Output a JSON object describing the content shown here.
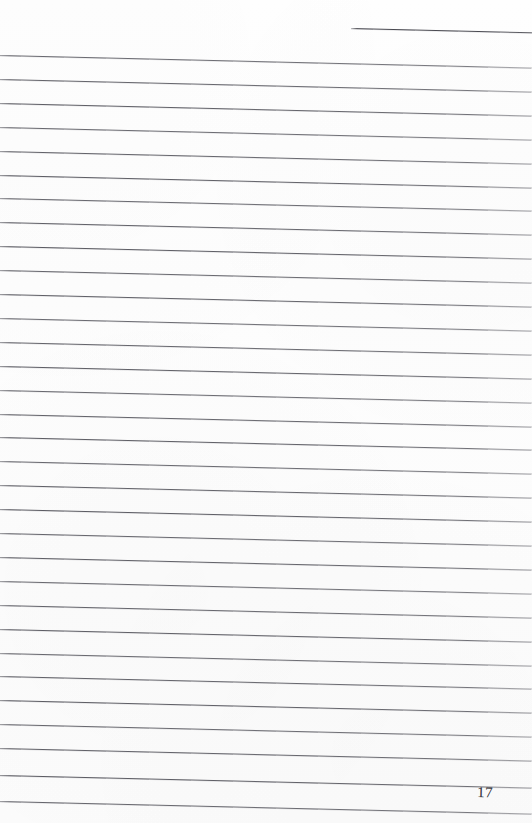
{
  "document": {
    "type": "scanned-ruled-notebook-page",
    "page_number": "17",
    "paper_color": "#fdfdfd",
    "rule_color": "#4a4a52",
    "folio_color": "#3b3b42",
    "canvas": {
      "width": 532,
      "height": 823
    },
    "skew_degrees": 1.35,
    "rule_spacing_px": 23.9,
    "written_content": "",
    "notes": "Blank ruled sheet: no handwriting, no headings, no margin rule; only the printed horizontal rules and the printed folio number."
  },
  "rules": {
    "count": 32,
    "first_full_rule_y": 55,
    "last_full_rule_y": 801,
    "partial_top_rule": {
      "label": "partial-top-right-rule",
      "x": 351,
      "y": 27.5,
      "width": 181
    },
    "lines": [
      {
        "y": 55.0,
        "width": 532
      },
      {
        "y": 78.9,
        "width": 532
      },
      {
        "y": 102.8,
        "width": 532
      },
      {
        "y": 126.7,
        "width": 532
      },
      {
        "y": 150.6,
        "width": 532
      },
      {
        "y": 174.5,
        "width": 532
      },
      {
        "y": 198.4,
        "width": 532
      },
      {
        "y": 222.3,
        "width": 532
      },
      {
        "y": 246.2,
        "width": 532
      },
      {
        "y": 270.1,
        "width": 532
      },
      {
        "y": 294.0,
        "width": 532
      },
      {
        "y": 317.9,
        "width": 532
      },
      {
        "y": 341.8,
        "width": 532
      },
      {
        "y": 365.7,
        "width": 532
      },
      {
        "y": 389.6,
        "width": 532
      },
      {
        "y": 413.5,
        "width": 532
      },
      {
        "y": 437.4,
        "width": 532
      },
      {
        "y": 461.3,
        "width": 532
      },
      {
        "y": 485.2,
        "width": 532
      },
      {
        "y": 509.1,
        "width": 532
      },
      {
        "y": 533.0,
        "width": 532
      },
      {
        "y": 556.9,
        "width": 532
      },
      {
        "y": 580.8,
        "width": 532
      },
      {
        "y": 604.7,
        "width": 532
      },
      {
        "y": 628.6,
        "width": 532
      },
      {
        "y": 652.5,
        "width": 532
      },
      {
        "y": 676.4,
        "width": 532
      },
      {
        "y": 700.3,
        "width": 532
      },
      {
        "y": 724.2,
        "width": 532
      },
      {
        "y": 748.1,
        "width": 532
      },
      {
        "y": 775.0,
        "width": 532
      },
      {
        "y": 800.5,
        "width": 532
      }
    ]
  },
  "folio": {
    "label": "17",
    "x": 477,
    "y": 785,
    "align": "bottom-right"
  }
}
